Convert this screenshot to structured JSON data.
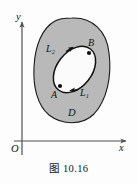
{
  "figure": {
    "caption": "图 10.16",
    "caption_number": "10.16",
    "caption_prefix": "图"
  },
  "axes": {
    "origin_label": "O",
    "x_axis_label": "x",
    "y_axis_label": "y",
    "x_axis": {
      "x1": 14,
      "y1": 141,
      "x2": 130,
      "y2": 141
    },
    "y_axis": {
      "x1": 22,
      "y1": 155,
      "x2": 22,
      "y2": 18
    },
    "axis_color": "#4f4f56",
    "arrowheads": [
      "x-axis-arrow",
      "y-axis-arrow"
    ]
  },
  "region": {
    "name": "D",
    "label": "D",
    "label_x": 71,
    "label_y": 113,
    "fill_color": "#b9b9b9",
    "stroke_color": "#1a1a1a",
    "outline_path": "M 72 18 C 92 17 107 31 109 53 C 112 76 107 100 94 114 C 82 126 62 125 49 115 C 37 105 33 86 34 67 C 35 46 42 28 55 21 C 60 18 66 18 72 18 Z"
  },
  "curve": {
    "name": "oriented-closed-curve",
    "stroke_color": "#111111",
    "ellipse": {
      "cx": 74.5,
      "cy": 69.5,
      "rx": 17.5,
      "ry": 26,
      "rotation_deg": 38
    },
    "arcs": [
      {
        "id": "L1",
        "label": "L₁",
        "label_plain": "L1",
        "label_x": 83,
        "label_y": 94,
        "side": "lower-right",
        "direction": "B to A"
      },
      {
        "id": "L2",
        "label": "L₂",
        "label_plain": "L2",
        "label_x": 50,
        "label_y": 50,
        "side": "upper-left",
        "direction": "A to B"
      }
    ],
    "arrow_markers": [
      "L1-arrow-toward-A",
      "L2-arrow-toward-B"
    ]
  },
  "points": [
    {
      "id": "A",
      "label": "A",
      "x": 60,
      "y": 86,
      "label_x": 52,
      "label_y": 97,
      "dot_r": 2.1
    },
    {
      "id": "B",
      "label": "B",
      "x": 89,
      "y": 53,
      "label_x": 89,
      "label_y": 44,
      "dot_r": 2.1
    }
  ]
}
